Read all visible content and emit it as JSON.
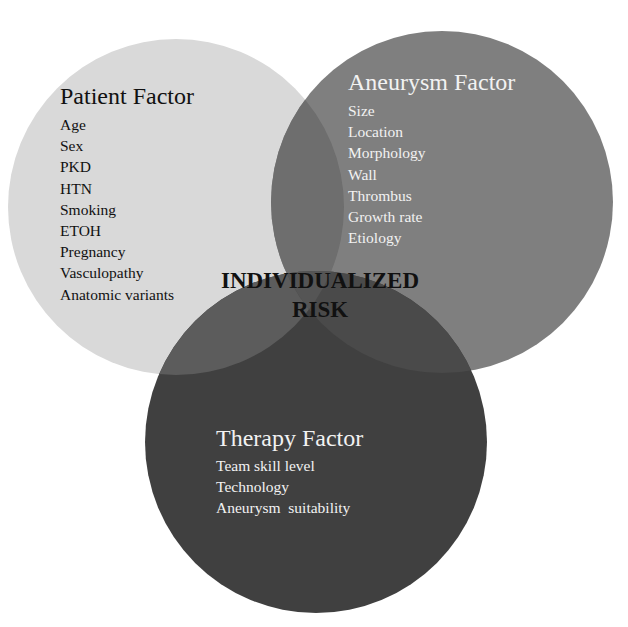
{
  "diagram": {
    "type": "venn",
    "center_label": [
      "INDIVIDUALIZED",
      "RISK"
    ],
    "circles": [
      {
        "id": "patient",
        "title": "Patient Factor",
        "items": [
          "Age",
          "Sex",
          "PKD",
          "HTN",
          "Smoking",
          "ETOH",
          "Pregnancy",
          "Vasculopathy",
          "Anatomic variants"
        ],
        "fill": "#d9d9d9",
        "text_color": "#111111"
      },
      {
        "id": "aneurysm",
        "title": "Aneurysm Factor",
        "items": [
          "Size",
          "Location",
          "Morphology",
          "Wall",
          "Thrombus",
          "Growth rate",
          "Etiology"
        ],
        "fill": "#7f7f7f",
        "text_color": "#f2f2f2"
      },
      {
        "id": "therapy",
        "title": "Therapy Factor",
        "items": [
          "Team skill level",
          "Technology",
          "Aneurysm  suitability"
        ],
        "fill": "#404040",
        "text_color": "#f2f2f2"
      }
    ],
    "overlap_colors": {
      "patient_aneurysm": "#6e6e6e",
      "patient_therapy": "#5c5c5c",
      "aneurysm_therapy": "#4a4a4a",
      "all_three": "#555555"
    },
    "background": "#ffffff"
  }
}
